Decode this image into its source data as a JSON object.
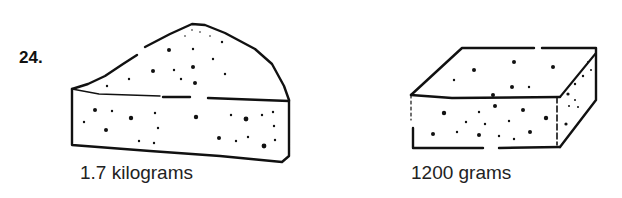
{
  "problem": {
    "number": "24.",
    "items": [
      {
        "shape": "cheese-wedge",
        "label": "1.7 kilograms"
      },
      {
        "shape": "cheese-block",
        "label": "1200 grams"
      }
    ]
  }
}
